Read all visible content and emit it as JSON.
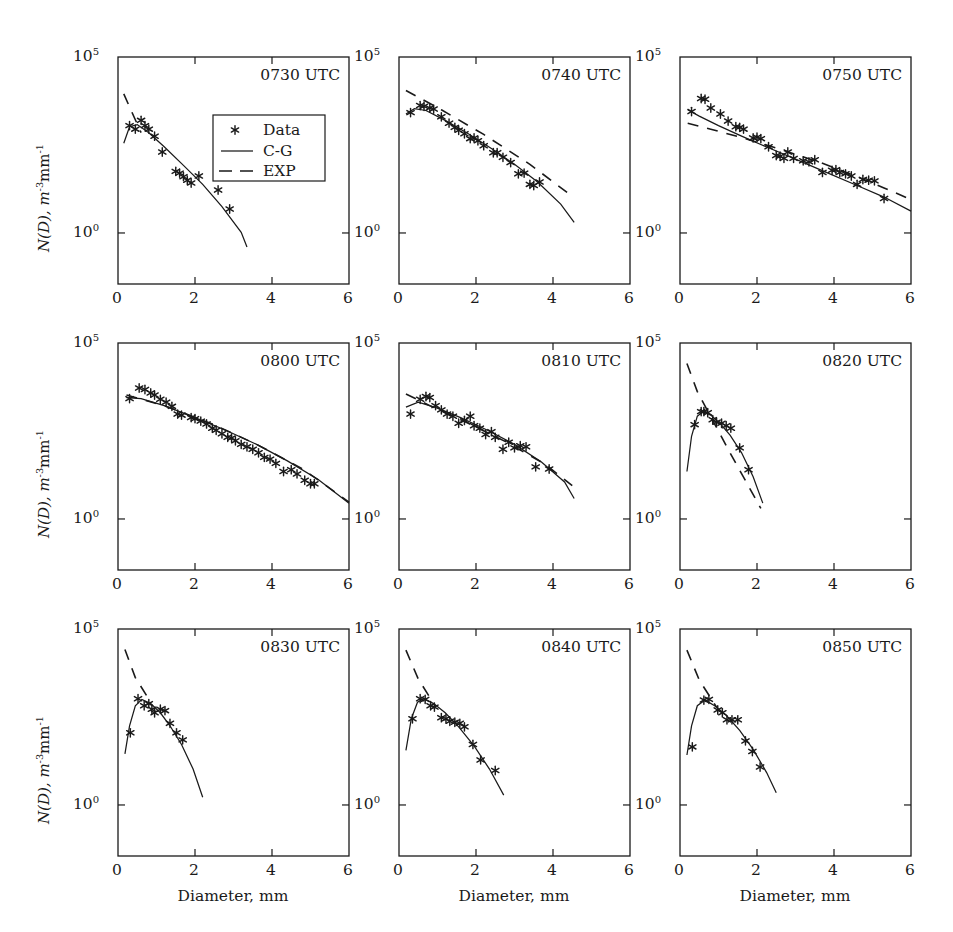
{
  "figure": {
    "axis_label_y": "N(D), m",
    "axis_label_y_sup1": "-3",
    "axis_label_y_mid": "mm",
    "axis_label_y_sup2": "-1",
    "axis_label_x": "Diameter, mm",
    "ytick_top": "10",
    "ytick_top_sup": "5",
    "ytick_bottom": "10",
    "ytick_bottom_sup": "0",
    "xticks": [
      "0",
      "2",
      "4",
      "6"
    ],
    "line_color": "#1a1a1a",
    "marker_color": "#1a1a1a",
    "frame_color": "#1a1a1a",
    "background": "#ffffff"
  },
  "legend": {
    "position": "panel-1-center",
    "items": [
      {
        "label": "Data",
        "style": "marker-asterisk"
      },
      {
        "label": "C-G",
        "style": "solid-line"
      },
      {
        "label": "EXP",
        "style": "dashed-line"
      }
    ]
  },
  "chart_data": {
    "type": "scatter",
    "title": "",
    "subtitle": "",
    "xlabel": "Diameter, mm",
    "ylabel": "N(D), m^-3 mm^-1",
    "xlim": [
      0,
      6
    ],
    "ylim_log10": [
      -1.45,
      5
    ],
    "yscale": "log",
    "grid": false,
    "legend_position": "inside-panel-1",
    "xticks": [
      0,
      2,
      4,
      6
    ],
    "yticks_log10": [
      0,
      5
    ],
    "panels": [
      {
        "label": "0730 UTC",
        "row": 0,
        "col": 0,
        "series": [
          {
            "name": "Data",
            "type": "scatter",
            "x": [
              0.3,
              0.45,
              0.6,
              0.7,
              0.8,
              0.95,
              1.15,
              1.5,
              1.6,
              1.7,
              1.8,
              1.9,
              2.1,
              2.6,
              2.9
            ],
            "y_log10": [
              3.05,
              2.95,
              3.2,
              3.05,
              2.95,
              2.75,
              2.3,
              1.75,
              1.7,
              1.6,
              1.5,
              1.42,
              1.62,
              1.22,
              0.68
            ]
          },
          {
            "name": "C-G",
            "type": "line",
            "x": [
              0.15,
              0.3,
              0.5,
              0.8,
              1.2,
              1.7,
              2.2,
              2.7,
              3.2,
              3.35
            ],
            "y_log10": [
              2.55,
              3.02,
              3.08,
              2.85,
              2.45,
              1.92,
              1.38,
              0.75,
              0.02,
              -0.4
            ]
          },
          {
            "name": "EXP",
            "type": "line",
            "x": [
              0.15,
              0.6
            ],
            "y_log10": [
              3.95,
              2.85
            ]
          }
        ]
      },
      {
        "label": "0740 UTC",
        "row": 0,
        "col": 1,
        "series": [
          {
            "name": "Data",
            "type": "scatter",
            "x": [
              0.3,
              0.55,
              0.65,
              0.8,
              0.9,
              1.1,
              1.3,
              1.45,
              1.55,
              1.7,
              1.85,
              1.95,
              2.05,
              2.2,
              2.45,
              2.55,
              2.7,
              2.9,
              3.1,
              3.25,
              3.4,
              3.5,
              3.65
            ],
            "y_log10": [
              3.42,
              3.62,
              3.6,
              3.55,
              3.52,
              3.3,
              3.12,
              3.0,
              2.92,
              2.82,
              2.68,
              2.7,
              2.62,
              2.48,
              2.28,
              2.28,
              2.15,
              2.0,
              1.68,
              1.7,
              1.38,
              1.35,
              1.45
            ]
          },
          {
            "name": "C-G",
            "type": "line",
            "x": [
              0.18,
              0.4,
              0.7,
              1.2,
              1.8,
              2.4,
              3.0,
              3.6,
              4.2,
              4.55
            ],
            "y_log10": [
              3.38,
              3.53,
              3.48,
              3.2,
              2.82,
              2.4,
              1.95,
              1.45,
              0.82,
              0.3
            ]
          },
          {
            "name": "EXP",
            "type": "line",
            "x": [
              0.18,
              1.1,
              2.2,
              3.4,
              4.55
            ],
            "y_log10": [
              4.05,
              3.5,
              2.8,
              1.95,
              1.0
            ]
          }
        ]
      },
      {
        "label": "0750 UTC",
        "row": 0,
        "col": 2,
        "series": [
          {
            "name": "Data",
            "type": "scatter",
            "x": [
              0.3,
              0.55,
              0.65,
              0.8,
              1.05,
              1.25,
              1.45,
              1.55,
              1.65,
              1.9,
              2.0,
              2.1,
              2.3,
              2.5,
              2.6,
              2.7,
              2.8,
              2.95,
              3.2,
              3.35,
              3.5,
              3.7,
              3.95,
              4.05,
              4.15,
              4.3,
              4.45,
              4.6,
              4.75,
              4.9,
              5.05,
              5.3
            ],
            "y_log10": [
              3.45,
              3.82,
              3.8,
              3.55,
              3.38,
              3.18,
              3.02,
              3.0,
              2.95,
              2.7,
              2.72,
              2.68,
              2.45,
              2.2,
              2.18,
              2.12,
              2.3,
              2.12,
              2.05,
              2.02,
              2.08,
              1.72,
              1.78,
              1.8,
              1.72,
              1.68,
              1.62,
              1.38,
              1.52,
              1.5,
              1.48,
              0.98
            ]
          },
          {
            "name": "C-G",
            "type": "line",
            "x": [
              0.2,
              0.5,
              1.0,
              1.6,
              2.3,
              3.0,
              3.8,
              4.6,
              5.3,
              6.0
            ],
            "y_log10": [
              3.5,
              3.32,
              3.05,
              2.75,
              2.42,
              2.1,
              1.72,
              1.35,
              1.02,
              0.62
            ]
          },
          {
            "name": "EXP",
            "type": "line",
            "x": [
              0.2,
              0.8,
              1.7,
              2.6,
              3.6,
              4.6,
              5.3,
              6.0
            ],
            "y_log10": [
              3.12,
              2.95,
              2.68,
              2.38,
              2.02,
              1.6,
              1.28,
              0.95
            ]
          }
        ]
      },
      {
        "label": "0800 UTC",
        "row": 1,
        "col": 0,
        "series": [
          {
            "name": "Data",
            "type": "scatter",
            "x": [
              0.3,
              0.55,
              0.7,
              0.85,
              0.95,
              1.1,
              1.25,
              1.4,
              1.55,
              1.65,
              1.9,
              2.0,
              2.15,
              2.3,
              2.45,
              2.55,
              2.7,
              2.85,
              2.95,
              3.05,
              3.2,
              3.35,
              3.5,
              3.65,
              3.8,
              3.95,
              4.1,
              4.3,
              4.5,
              4.65,
              4.85,
              5.0,
              5.1
            ],
            "y_log10": [
              3.42,
              3.72,
              3.68,
              3.58,
              3.52,
              3.4,
              3.32,
              3.2,
              2.98,
              2.95,
              2.88,
              2.85,
              2.78,
              2.7,
              2.58,
              2.52,
              2.42,
              2.32,
              2.3,
              2.22,
              2.12,
              2.05,
              1.98,
              1.88,
              1.75,
              1.7,
              1.58,
              1.35,
              1.4,
              1.28,
              1.1,
              1.0,
              1.0
            ]
          },
          {
            "name": "C-G",
            "type": "line",
            "x": [
              0.22,
              0.6,
              1.2,
              2.0,
              2.8,
              3.6,
              4.4,
              5.2,
              6.0
            ],
            "y_log10": [
              3.45,
              3.42,
              3.22,
              2.88,
              2.52,
              2.12,
              1.65,
              1.12,
              0.45
            ]
          },
          {
            "name": "EXP",
            "type": "line",
            "x": [
              0.22,
              1.2,
              2.4,
              3.6,
              4.8,
              6.0
            ],
            "y_log10": [
              3.52,
              3.22,
              2.72,
              2.12,
              1.42,
              0.48
            ]
          }
        ]
      },
      {
        "label": "0810 UTC",
        "row": 1,
        "col": 1,
        "series": [
          {
            "name": "Data",
            "type": "scatter",
            "x": [
              0.3,
              0.55,
              0.7,
              0.8,
              0.95,
              1.1,
              1.25,
              1.4,
              1.55,
              1.7,
              1.85,
              1.95,
              2.1,
              2.25,
              2.4,
              2.5,
              2.7,
              2.85,
              3.0,
              3.15,
              3.3,
              3.55,
              3.9
            ],
            "y_log10": [
              2.98,
              3.4,
              3.48,
              3.45,
              3.22,
              3.1,
              2.98,
              2.92,
              2.72,
              2.8,
              2.92,
              2.65,
              2.58,
              2.4,
              2.48,
              2.32,
              1.98,
              2.18,
              2.02,
              2.08,
              2.05,
              1.48,
              1.42
            ]
          },
          {
            "name": "C-G",
            "type": "line",
            "x": [
              0.18,
              0.5,
              1.0,
              1.6,
              2.3,
              3.0,
              3.7,
              4.3,
              4.55
            ],
            "y_log10": [
              3.18,
              3.32,
              3.15,
              2.88,
              2.52,
              2.12,
              1.62,
              1.05,
              0.58
            ]
          },
          {
            "name": "EXP",
            "type": "line",
            "x": [
              0.18,
              0.8,
              1.8,
              2.8,
              3.8,
              4.5
            ],
            "y_log10": [
              3.55,
              3.22,
              2.72,
              2.18,
              1.55,
              0.95
            ]
          }
        ]
      },
      {
        "label": "0820 UTC",
        "row": 1,
        "col": 2,
        "series": [
          {
            "name": "Data",
            "type": "scatter",
            "x": [
              0.38,
              0.55,
              0.62,
              0.72,
              0.85,
              0.95,
              1.08,
              1.2,
              1.32,
              1.55,
              1.78
            ],
            "y_log10": [
              2.68,
              3.05,
              3.05,
              3.02,
              2.82,
              2.75,
              2.72,
              2.65,
              2.58,
              2.02,
              1.4
            ]
          },
          {
            "name": "C-G",
            "type": "line",
            "x": [
              0.18,
              0.3,
              0.45,
              0.6,
              0.8,
              1.05,
              1.3,
              1.6,
              1.9,
              2.15
            ],
            "y_log10": [
              1.35,
              2.35,
              2.92,
              3.05,
              2.95,
              2.7,
              2.38,
              1.88,
              1.2,
              0.45
            ]
          },
          {
            "name": "EXP",
            "type": "line",
            "x": [
              0.18,
              0.45,
              1.3,
              2.1
            ],
            "y_log10": [
              4.42,
              3.62,
              1.88,
              0.3
            ]
          }
        ]
      },
      {
        "label": "0830 UTC",
        "row": 2,
        "col": 0,
        "series": [
          {
            "name": "Data",
            "type": "scatter",
            "x": [
              0.32,
              0.52,
              0.68,
              0.8,
              0.88,
              0.95,
              1.1,
              1.22,
              1.35,
              1.52,
              1.68
            ],
            "y_log10": [
              2.05,
              3.02,
              2.82,
              2.88,
              2.72,
              2.62,
              2.72,
              2.68,
              2.32,
              2.05,
              1.85
            ]
          },
          {
            "name": "C-G",
            "type": "line",
            "x": [
              0.18,
              0.3,
              0.45,
              0.62,
              0.85,
              1.1,
              1.35,
              1.65,
              1.95,
              2.2
            ],
            "y_log10": [
              1.45,
              2.25,
              2.82,
              3.0,
              2.88,
              2.62,
              2.25,
              1.72,
              1.02,
              0.22
            ]
          },
          {
            "name": "EXP",
            "type": "line",
            "x": [
              0.18,
              0.45,
              0.85
            ],
            "y_log10": [
              4.42,
              3.62,
              2.92
            ]
          }
        ]
      },
      {
        "label": "0840 UTC",
        "row": 2,
        "col": 1,
        "series": [
          {
            "name": "Data",
            "type": "scatter",
            "x": [
              0.35,
              0.55,
              0.68,
              0.82,
              0.92,
              1.1,
              1.22,
              1.32,
              1.45,
              1.58,
              1.7,
              1.92,
              2.12,
              2.5
            ],
            "y_log10": [
              2.45,
              3.02,
              3.0,
              2.82,
              2.78,
              2.48,
              2.45,
              2.38,
              2.35,
              2.32,
              2.22,
              1.72,
              1.28,
              0.98
            ]
          },
          {
            "name": "C-G",
            "type": "line",
            "x": [
              0.18,
              0.32,
              0.48,
              0.65,
              0.9,
              1.2,
              1.55,
              1.95,
              2.35,
              2.72
            ],
            "y_log10": [
              1.55,
              2.45,
              2.92,
              3.02,
              2.88,
              2.62,
              2.22,
              1.68,
              1.02,
              0.28
            ]
          },
          {
            "name": "EXP",
            "type": "line",
            "x": [
              0.18,
              0.5,
              0.95
            ],
            "y_log10": [
              4.4,
              3.58,
              2.8
            ]
          }
        ]
      },
      {
        "label": "0850 UTC",
        "row": 2,
        "col": 2,
        "series": [
          {
            "name": "Data",
            "type": "scatter",
            "x": [
              0.32,
              0.62,
              0.75,
              0.98,
              1.1,
              1.22,
              1.35,
              1.5,
              1.7,
              1.88,
              2.08
            ],
            "y_log10": [
              1.65,
              2.98,
              3.0,
              2.7,
              2.62,
              2.42,
              2.42,
              2.42,
              1.82,
              1.52,
              1.08
            ]
          },
          {
            "name": "C-G",
            "type": "line",
            "x": [
              0.18,
              0.3,
              0.45,
              0.65,
              0.9,
              1.2,
              1.55,
              1.9,
              2.25,
              2.5
            ],
            "y_log10": [
              1.42,
              2.25,
              2.82,
              2.98,
              2.82,
              2.55,
              2.12,
              1.58,
              0.92,
              0.35
            ]
          },
          {
            "name": "EXP",
            "type": "line",
            "x": [
              0.18,
              0.5,
              0.95
            ],
            "y_log10": [
              4.4,
              3.55,
              2.78
            ]
          }
        ]
      }
    ]
  }
}
